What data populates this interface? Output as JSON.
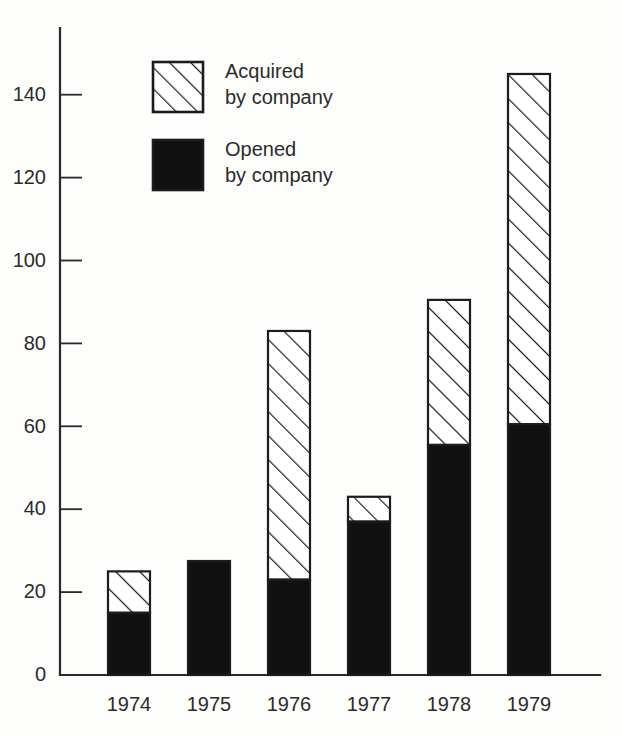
{
  "chart_data": {
    "type": "bar",
    "subtype": "stacked",
    "title": "",
    "subtitle": "",
    "xlabel": "",
    "ylabel": "",
    "categories": [
      "1974",
      "1975",
      "1976",
      "1977",
      "1978",
      "1979"
    ],
    "series": [
      {
        "name": "Opened by company",
        "fill": "solid-black",
        "values": [
          15,
          27.5,
          23,
          37,
          55.5,
          60.5
        ]
      },
      {
        "name": "Acquired by company",
        "fill": "diagonal-hatch",
        "values": [
          10,
          0,
          60,
          6,
          35,
          84.5
        ]
      }
    ],
    "totals": [
      25,
      27.5,
      83,
      43,
      90.5,
      145
    ],
    "ylim": [
      0,
      152
    ],
    "yticks": [
      0,
      20,
      40,
      60,
      80,
      100,
      120,
      140
    ],
    "ytick_labels": [
      "0",
      "20",
      "40",
      "60",
      "80",
      "100",
      "120",
      "140"
    ],
    "grid": false,
    "legend_position": "top-center-inside",
    "legend": [
      {
        "label_line1": "Acquired",
        "label_line2": "by company",
        "swatch": "diagonal-hatch"
      },
      {
        "label_line1": "Opened",
        "label_line2": "by company",
        "swatch": "solid-black"
      }
    ],
    "colors": {
      "axis": "#2a2a2a",
      "bar_outline": "#1c1c1c",
      "solid_fill": "#111111",
      "hatch_stroke": "#1c1c1c",
      "background": "#fdfdfc",
      "text": "#2b2b2b"
    }
  },
  "layout": {
    "plot_left": 60,
    "plot_baseline_y": 675,
    "px_per_unit": 4.145,
    "bar_width": 42,
    "bar_step": 80,
    "first_bar_left": 108,
    "axis_top_y": 28,
    "axis_right_x": 600,
    "tick_length": 22,
    "legend_x": 153,
    "legend_y1": 62,
    "legend_y2": 140,
    "legend_swatch_size": 50
  }
}
